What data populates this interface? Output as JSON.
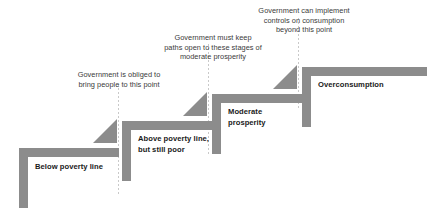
{
  "diagram": {
    "type": "stair-step-diagram",
    "colors": {
      "bar": "#8c8c8c",
      "riser": "#8c8c8c",
      "divider": "#c9c9c9",
      "step_label_text": "#1a1a1a",
      "callout_text": "#3a3a3a",
      "background": "#ffffff"
    },
    "steps": [
      {
        "id": "below-poverty-line",
        "label": "Below poverty line",
        "level": 1
      },
      {
        "id": "above-poverty-line",
        "label": "Above poverty line,\nbut still poor",
        "level": 2
      },
      {
        "id": "moderate-prosperity",
        "label": "Moderate\nprosperity",
        "level": 3
      },
      {
        "id": "overconsumption",
        "label": "Overconsumption",
        "level": 4
      }
    ],
    "callouts": [
      {
        "id": "obliged-callout",
        "text": "Government is obliged to\nbring people to this point",
        "points_to": "above-poverty-line"
      },
      {
        "id": "paths-open-callout",
        "text": "Government must keep\npaths open to these stages of\nmoderate prosperity",
        "points_to": "moderate-prosperity"
      },
      {
        "id": "controls-callout",
        "text": "Government can implement\ncontrols on consumption\nbeyond this point",
        "points_to": "overconsumption"
      }
    ],
    "dividers": [
      {
        "id": "divider-1",
        "after_step": "below-poverty-line"
      },
      {
        "id": "divider-2",
        "after_step": "above-poverty-line"
      },
      {
        "id": "divider-3",
        "after_step": "moderate-prosperity"
      }
    ]
  }
}
